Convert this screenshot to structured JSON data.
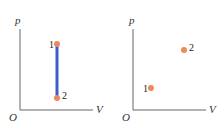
{
  "diagrams": [
    {
      "id": "left",
      "y_axis_label": "p",
      "x_axis_label": "V",
      "origin_label": "O",
      "points": [
        {
          "label": "1",
          "x": 57,
          "y": 44
        },
        {
          "label": "2",
          "x": 57,
          "y": 98
        }
      ],
      "process_line": {
        "from": "1",
        "to": "2",
        "color": "#3a5fcd"
      }
    },
    {
      "id": "right",
      "y_axis_label": "p",
      "x_axis_label": "V",
      "origin_label": "O",
      "points": [
        {
          "label": "1",
          "x": 150,
          "y": 88
        },
        {
          "label": "2",
          "x": 184,
          "y": 50
        }
      ]
    }
  ],
  "colors": {
    "point": "#ec8a5a",
    "axis": "#666666",
    "line": "#3a5fcd"
  }
}
